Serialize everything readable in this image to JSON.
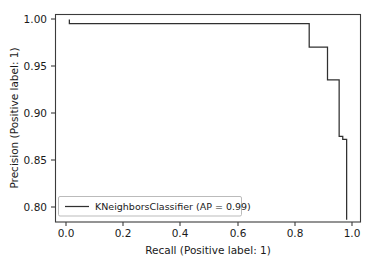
{
  "chart_data": {
    "type": "line",
    "title": "",
    "xlabel": "Recall (Positive label: 1)",
    "ylabel": "Precision (Positive label: 1)",
    "xlim": [
      -0.05,
      1.05
    ],
    "ylim": [
      0.7755,
      1.0055
    ],
    "grid": false,
    "legend_position": "lower left",
    "xticks": [
      0.0,
      0.2,
      0.4,
      0.6,
      0.8,
      1.0
    ],
    "xtick_labels": [
      "0.0",
      "0.2",
      "0.4",
      "0.6",
      "0.8",
      "1.0"
    ],
    "yticks": [
      0.8,
      0.85,
      0.9,
      0.95,
      1.0
    ],
    "ytick_labels": [
      "0.80",
      "0.85",
      "0.90",
      "0.95",
      "1.00"
    ],
    "series": [
      {
        "name": "KNeighborsClassifier (AP = 0.99)",
        "label": "KNeighborsClassifier (AP = 0.99)",
        "average_precision": 0.99,
        "drawstyle": "steps-post",
        "color": "#303030",
        "x": [
          0.0,
          0.0,
          0.865,
          0.865,
          0.931,
          0.931,
          0.973,
          0.973,
          0.986,
          0.986,
          1.0,
          1.0
        ],
        "y": [
          1.0,
          0.9955,
          0.9955,
          0.9693,
          0.9693,
          0.933,
          0.933,
          0.8705,
          0.8705,
          0.867,
          0.867,
          0.778
        ]
      }
    ]
  },
  "legend": {
    "entries": [
      {
        "label": "KNeighborsClassifier (AP = 0.99)",
        "color": "#303030"
      }
    ]
  },
  "axes": {
    "x_label": "Recall (Positive label: 1)",
    "y_label": "Precision (Positive label: 1)",
    "x_tick_labels": [
      "0.0",
      "0.2",
      "0.4",
      "0.6",
      "0.8",
      "1.0"
    ],
    "y_tick_labels": [
      "1.00",
      "0.95",
      "0.90",
      "0.85",
      "0.80"
    ]
  }
}
